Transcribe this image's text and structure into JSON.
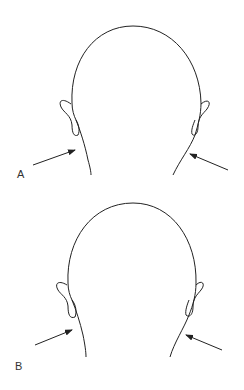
{
  "figures": [
    {
      "label": "A",
      "description": "Back of head with arrows pointing at neck contour"
    },
    {
      "label": "B",
      "description": "Back of head with arrows pointing at neck contour"
    }
  ]
}
